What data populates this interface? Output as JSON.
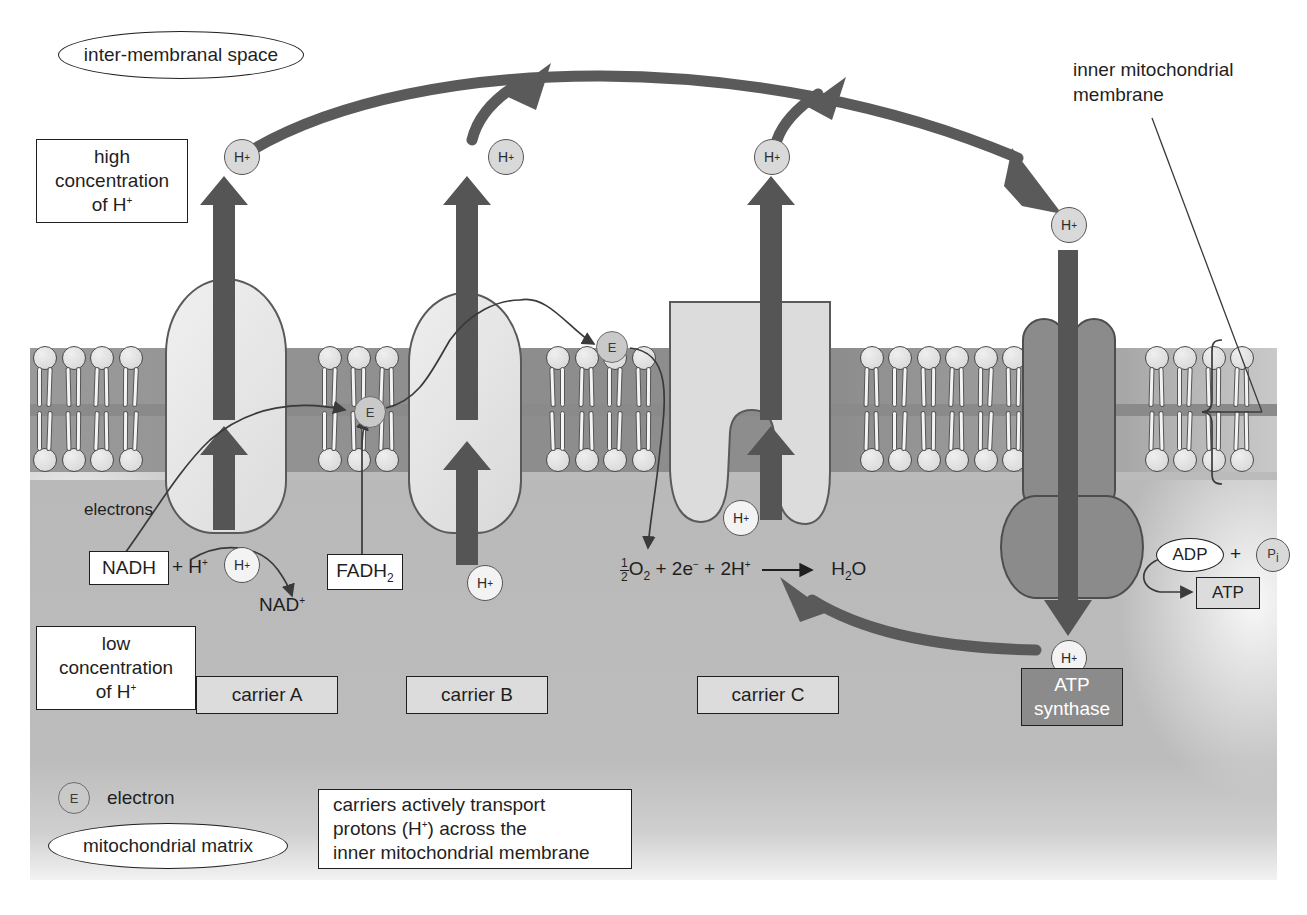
{
  "diagram": {
    "regions": {
      "inter_membranal_space": "inter-membranal space",
      "mitochondrial_matrix": "mitochondrial matrix"
    },
    "concentration_labels": {
      "high": "high\nconcentration\nof H+",
      "high_line1": "high",
      "high_line2": "concentration",
      "high_line3": "of H",
      "high_sup": "+",
      "low_line1": "low",
      "low_line2": "concentration",
      "low_line3": "of H",
      "low_sup": "+"
    },
    "membrane_callout": {
      "line1": "inner mitochondrial",
      "line2": "membrane"
    },
    "carriers": [
      {
        "id": "carrier-a",
        "label": "carrier A"
      },
      {
        "id": "carrier-b",
        "label": "carrier B"
      },
      {
        "id": "carrier-c",
        "label": "carrier C"
      }
    ],
    "atp_synthase": {
      "line1": "ATP",
      "line2": "synthase"
    },
    "molecules": {
      "nadh": "NADH",
      "nadh_plus_h": "+ H",
      "nadh_sup": "+",
      "nad_plus": "NAD",
      "nad_sup": "+",
      "fadh2_text": "FADH",
      "fadh2_sub": "2",
      "adp": "ADP",
      "plus": "+",
      "pi_letter": "P",
      "pi_sub": "i",
      "atp": "ATP"
    },
    "reaction": {
      "frac_num": "1",
      "frac_den": "2",
      "o2": "O",
      "o2_sub": "2",
      "term_2e": "+ 2e",
      "e_sup": "−",
      "term_2h": "+ 2H",
      "h_sup": "+",
      "arrow": "⟶",
      "product": "H",
      "product_sub": "2",
      "product_tail": "O"
    },
    "annotations": {
      "electrons": "electrons"
    },
    "key": {
      "electron_symbol": "E",
      "electron_label": "electron"
    },
    "caption": {
      "line1": "carriers actively transport",
      "line2a": "protons (H",
      "line2_sup": "+",
      "line2b": ") across the",
      "line3": "inner mitochondrial membrane"
    },
    "proton_symbol": {
      "letter": "H",
      "charge": "+"
    },
    "colors": {
      "matrix": "#b9b9b9",
      "membrane_core": "#8d8d8d",
      "carrier_fill": "#e4e4e4",
      "synthase_fill": "#8b8b8b",
      "arrow": "#555555",
      "outline": "#1f1f1f"
    }
  }
}
